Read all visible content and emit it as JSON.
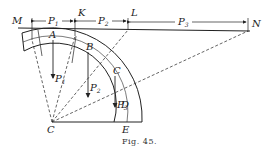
{
  "figure": {
    "caption": "Fig. 45.",
    "points": {
      "M": "M",
      "K": "K",
      "L": "L",
      "N": "N",
      "A": "A",
      "B": "B",
      "C": "C",
      "D": "D",
      "E": "E"
    },
    "forces": {
      "P1": "P",
      "P1_sub": "1",
      "P2": "P",
      "P2_sub": "2",
      "P3": "P",
      "P3_sub": "3"
    },
    "dimensions": [
      {
        "label": "P",
        "sub": "1",
        "from": "M",
        "to": "K"
      },
      {
        "label": "P",
        "sub": "2",
        "from": "K",
        "to": "L"
      },
      {
        "label": "P",
        "sub": "3",
        "from": "L",
        "to": "N"
      }
    ]
  }
}
